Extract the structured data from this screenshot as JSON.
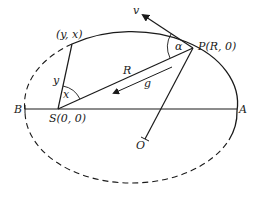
{
  "diagram": {
    "type": "orbit-ellipse",
    "labels": {
      "velocity": "v",
      "point_p": "P(R, 0)",
      "angle_alpha": "α",
      "point_yx": "(y, x)",
      "radius": "R",
      "gravity": "g",
      "side_y": "y",
      "angle_x": "x",
      "vertex_b": "B",
      "focus_s": "S(0, 0)",
      "vertex_a": "A",
      "center_o": "O"
    },
    "colors": {
      "stroke": "#1a1a1a",
      "background": "#ffffff"
    }
  }
}
